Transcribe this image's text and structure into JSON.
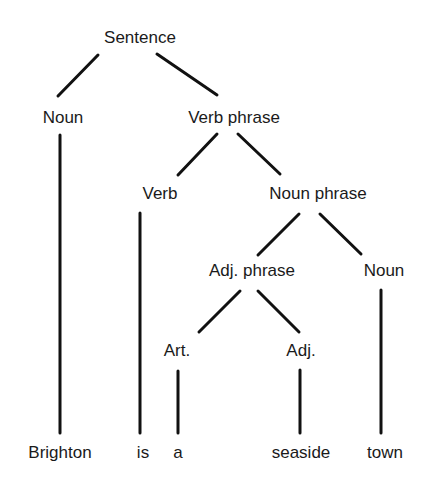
{
  "diagram": {
    "type": "parse-tree",
    "nodes": [
      {
        "id": "s",
        "label": "Sentence",
        "x": 140,
        "y": 28
      },
      {
        "id": "n1",
        "label": "Noun",
        "x": 63,
        "y": 108
      },
      {
        "id": "vp",
        "label": "Verb phrase",
        "x": 234,
        "y": 108
      },
      {
        "id": "v",
        "label": "Verb",
        "x": 160,
        "y": 184
      },
      {
        "id": "np",
        "label": "Noun phrase",
        "x": 318,
        "y": 184
      },
      {
        "id": "adjp",
        "label": "Adj. phrase",
        "x": 252,
        "y": 261
      },
      {
        "id": "n2",
        "label": "Noun",
        "x": 384,
        "y": 261
      },
      {
        "id": "art",
        "label": "Art.",
        "x": 177,
        "y": 341
      },
      {
        "id": "adj",
        "label": "Adj.",
        "x": 301,
        "y": 341
      },
      {
        "id": "w1",
        "label": "Brighton",
        "x": 60,
        "y": 443
      },
      {
        "id": "w2",
        "label": "is",
        "x": 143,
        "y": 443
      },
      {
        "id": "w3",
        "label": "a",
        "x": 178,
        "y": 443
      },
      {
        "id": "w4",
        "label": "seaside",
        "x": 301,
        "y": 443
      },
      {
        "id": "w5",
        "label": "town",
        "x": 385,
        "y": 443
      }
    ],
    "edges": [
      {
        "from": "s",
        "to": "n1",
        "x1": 98,
        "y1": 55,
        "x2": 58,
        "y2": 96
      },
      {
        "from": "s",
        "to": "vp",
        "x1": 157,
        "y1": 54,
        "x2": 217,
        "y2": 95
      },
      {
        "from": "vp",
        "to": "v",
        "x1": 217,
        "y1": 134,
        "x2": 178,
        "y2": 175
      },
      {
        "from": "vp",
        "to": "np",
        "x1": 238,
        "y1": 134,
        "x2": 280,
        "y2": 174
      },
      {
        "from": "np",
        "to": "adjp",
        "x1": 299,
        "y1": 214,
        "x2": 258,
        "y2": 255
      },
      {
        "from": "np",
        "to": "n2",
        "x1": 320,
        "y1": 214,
        "x2": 361,
        "y2": 254
      },
      {
        "from": "adjp",
        "to": "art",
        "x1": 240,
        "y1": 291,
        "x2": 199,
        "y2": 332
      },
      {
        "from": "adjp",
        "to": "adj",
        "x1": 258,
        "y1": 291,
        "x2": 299,
        "y2": 332
      },
      {
        "from": "n1",
        "to": "w1",
        "x1": 60,
        "y1": 135,
        "x2": 60,
        "y2": 433
      },
      {
        "from": "v",
        "to": "w2",
        "x1": 140,
        "y1": 213,
        "x2": 140,
        "y2": 433
      },
      {
        "from": "art",
        "to": "w3",
        "x1": 178,
        "y1": 371,
        "x2": 178,
        "y2": 433
      },
      {
        "from": "adj",
        "to": "w4",
        "x1": 300,
        "y1": 370,
        "x2": 300,
        "y2": 433
      },
      {
        "from": "n2",
        "to": "w5",
        "x1": 381,
        "y1": 290,
        "x2": 381,
        "y2": 433
      }
    ],
    "sentence": "Brighton is a seaside town"
  }
}
